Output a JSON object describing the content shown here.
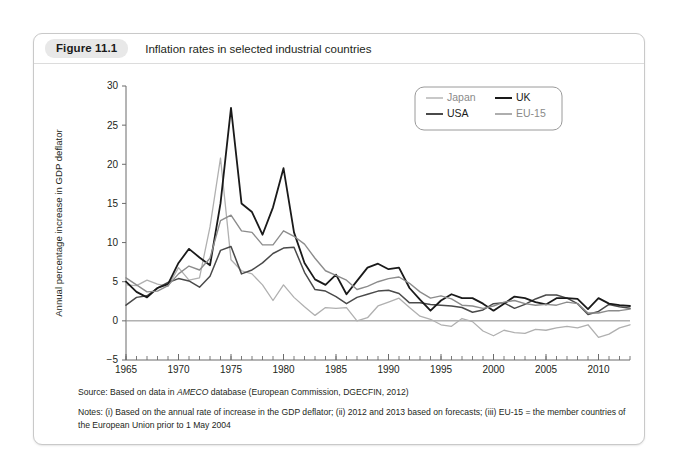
{
  "figure": {
    "number": "Figure 11.1",
    "title": "Inflation rates in selected industrial countries",
    "source_prefix": "Source: Based on data in ",
    "source_em": "AMECO",
    "source_suffix": " database (European Commission, DGECFIN, 2012)",
    "notes": "Notes: (i) Based on the annual rate of increase in the GDP deflator; (ii) 2012 and 2013 based on forecasts; (iii) EU-15 = the member countries of the European Union prior to 1 May 2004"
  },
  "colors": {
    "japan": "#b0b0b0",
    "uk": "#1a1a1a",
    "usa": "#4a4a4a",
    "eu15": "#8c8c8c",
    "axis": "#6b6b6b",
    "zero_line": "#8a8a8a",
    "card_border": "#c9c9c9",
    "pill_background": "#e8e8e8"
  },
  "chart_data": {
    "type": "line",
    "title": "Inflation rates in selected industrial countries",
    "xlabel": "",
    "ylabel": "Annual percentage increase in GDP deflator",
    "xlim": [
      1965,
      2013
    ],
    "ylim": [
      -5,
      30
    ],
    "ytick_step": 5,
    "yticks": [
      -5,
      0,
      5,
      10,
      15,
      20,
      25,
      30
    ],
    "xticks_labeled": [
      1965,
      1970,
      1975,
      1980,
      1985,
      1990,
      1995,
      2000,
      2005,
      2010
    ],
    "xtick_minor_step": 1,
    "grid": false,
    "zero_line": true,
    "legend_position": "top-right",
    "x": [
      1965,
      1966,
      1967,
      1968,
      1969,
      1970,
      1971,
      1972,
      1973,
      1974,
      1975,
      1976,
      1977,
      1978,
      1979,
      1980,
      1981,
      1982,
      1983,
      1984,
      1985,
      1986,
      1987,
      1988,
      1989,
      1990,
      1991,
      1992,
      1993,
      1994,
      1995,
      1996,
      1997,
      1998,
      1999,
      2000,
      2001,
      2002,
      2003,
      2004,
      2005,
      2006,
      2007,
      2008,
      2009,
      2010,
      2011,
      2012,
      2013
    ],
    "series": [
      {
        "name": "Japan",
        "color": "#b0b0b0",
        "width": 1.3,
        "values": [
          4.6,
          4.5,
          5.2,
          4.7,
          4.4,
          6.8,
          5.2,
          5.5,
          12.0,
          20.8,
          7.8,
          6.4,
          6.0,
          4.6,
          2.6,
          4.6,
          3.0,
          1.8,
          0.7,
          1.7,
          1.6,
          1.7,
          0.0,
          0.4,
          1.9,
          2.4,
          2.9,
          1.7,
          0.6,
          0.2,
          -0.5,
          -0.7,
          0.3,
          -0.1,
          -1.3,
          -1.9,
          -1.2,
          -1.5,
          -1.6,
          -1.1,
          -1.2,
          -0.9,
          -0.7,
          -0.9,
          -0.5,
          -2.1,
          -1.7,
          -0.9,
          -0.5
        ]
      },
      {
        "name": "USA",
        "color": "#4a4a4a",
        "width": 1.5,
        "values": [
          2.0,
          3.0,
          3.2,
          4.2,
          4.9,
          5.4,
          5.1,
          4.3,
          5.7,
          9.0,
          9.5,
          6.0,
          6.5,
          7.4,
          8.6,
          9.3,
          9.4,
          6.2,
          4.0,
          3.8,
          3.1,
          2.2,
          3.0,
          3.4,
          3.8,
          3.9,
          3.5,
          2.3,
          2.3,
          2.1,
          2.0,
          1.9,
          1.7,
          1.1,
          1.4,
          2.2,
          2.3,
          1.6,
          2.1,
          2.8,
          3.3,
          3.3,
          2.9,
          2.2,
          0.8,
          1.2,
          2.1,
          1.8,
          1.6
        ]
      },
      {
        "name": "UK",
        "color": "#1a1a1a",
        "width": 1.8,
        "values": [
          5.0,
          3.7,
          3.0,
          4.2,
          4.7,
          7.4,
          9.2,
          8.1,
          7.1,
          15.0,
          27.2,
          15.0,
          13.9,
          11.0,
          14.5,
          19.5,
          11.3,
          7.4,
          5.3,
          4.6,
          5.9,
          3.4,
          5.1,
          6.8,
          7.3,
          6.6,
          6.8,
          4.2,
          2.7,
          1.3,
          2.6,
          3.4,
          2.9,
          2.9,
          2.2,
          1.3,
          2.2,
          3.1,
          2.9,
          2.4,
          2.1,
          2.9,
          2.9,
          2.8,
          1.5,
          2.9,
          2.2,
          2.0,
          1.9
        ]
      },
      {
        "name": "EU-15",
        "color": "#8c8c8c",
        "width": 1.4,
        "values": [
          5.5,
          4.6,
          3.7,
          3.8,
          4.5,
          6.0,
          7.0,
          6.5,
          8.0,
          12.8,
          13.5,
          11.5,
          11.3,
          9.7,
          9.7,
          11.5,
          10.8,
          9.8,
          8.0,
          6.4,
          5.8,
          5.2,
          4.0,
          4.4,
          5.0,
          5.4,
          5.6,
          4.8,
          3.7,
          2.9,
          3.2,
          2.8,
          2.0,
          1.9,
          1.6,
          1.9,
          2.4,
          2.6,
          2.2,
          2.0,
          2.1,
          2.0,
          2.4,
          2.2,
          1.0,
          1.0,
          1.3,
          1.3,
          1.5
        ]
      }
    ],
    "legend": [
      {
        "label": "Japan",
        "color": "#b0b0b0"
      },
      {
        "label": "UK",
        "color": "#1a1a1a"
      },
      {
        "label": "USA",
        "color": "#4a4a4a"
      },
      {
        "label": "EU-15",
        "color": "#8c8c8c"
      }
    ]
  }
}
